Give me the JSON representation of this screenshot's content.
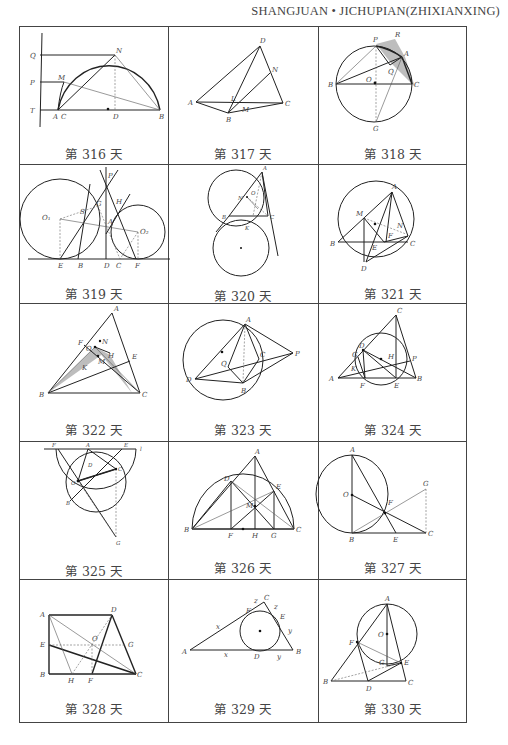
{
  "header": {
    "running_title": "SHANGJUAN • JICHUPIAN(ZHIXIANXING)"
  },
  "grid": {
    "columns": 3,
    "rows": 5,
    "cells": [
      {
        "caption": "第 316 天",
        "day": 316,
        "labels": [
          "Q",
          "P",
          "T",
          "A",
          "C",
          "D",
          "B",
          "M",
          "N"
        ]
      },
      {
        "caption": "第 317 天",
        "day": 317,
        "labels": [
          "D",
          "N",
          "A",
          "L",
          "M",
          "C",
          "B"
        ]
      },
      {
        "caption": "第 318 天",
        "day": 318,
        "labels": [
          "P",
          "R",
          "A",
          "Q",
          "B",
          "O",
          "C",
          "G"
        ]
      },
      {
        "caption": "第 319 天",
        "day": 319,
        "labels": [
          "P",
          "G",
          "H",
          "O1",
          "S",
          "A",
          "O2",
          "E",
          "B",
          "D",
          "C",
          "F"
        ]
      },
      {
        "caption": "第 320 天",
        "day": 320,
        "labels": [
          "A",
          "N",
          "O",
          "B",
          "C",
          "K"
        ]
      },
      {
        "caption": "第 321 天",
        "day": 321,
        "labels": [
          "A",
          "M",
          "N",
          "F",
          "B",
          "E",
          "C",
          "D"
        ]
      },
      {
        "caption": "第 322 天",
        "day": 322,
        "labels": [
          "A",
          "F",
          "N",
          "O",
          "H",
          "E",
          "M",
          "K",
          "B",
          "C"
        ]
      },
      {
        "caption": "第 323 天",
        "day": 323,
        "labels": [
          "A",
          "C",
          "P",
          "Q",
          "D",
          "B"
        ]
      },
      {
        "caption": "第 324 天",
        "day": 324,
        "labels": [
          "C",
          "D",
          "G",
          "H",
          "P",
          "K",
          "A",
          "F",
          "E",
          "B"
        ]
      },
      {
        "caption": "第 325 天",
        "day": 325,
        "labels": [
          "F",
          "A",
          "E",
          "l",
          "D",
          "C",
          "O",
          "B",
          "G"
        ]
      },
      {
        "caption": "第 326 天",
        "day": 326,
        "labels": [
          "A",
          "D",
          "E",
          "M",
          "B",
          "F",
          "H",
          "G",
          "C"
        ]
      },
      {
        "caption": "第 327 天",
        "day": 327,
        "labels": [
          "A",
          "O",
          "F",
          "G",
          "B",
          "E",
          "C"
        ]
      },
      {
        "caption": "第 328 天",
        "day": 328,
        "labels": [
          "A",
          "D",
          "E",
          "O",
          "G",
          "B",
          "H",
          "F",
          "C"
        ]
      },
      {
        "caption": "第 329 天",
        "day": 329,
        "labels": [
          "C",
          "z",
          "z",
          "F",
          "E",
          "x",
          "y",
          "A",
          "x",
          "D",
          "y",
          "B"
        ]
      },
      {
        "caption": "第 330 天",
        "day": 330,
        "labels": [
          "A",
          "O",
          "F",
          "G",
          "E",
          "B",
          "D",
          "C"
        ]
      }
    ]
  }
}
